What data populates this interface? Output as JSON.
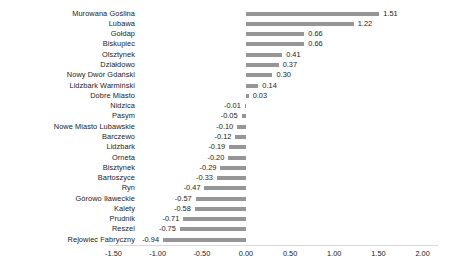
{
  "chart_data": {
    "type": "bar",
    "orientation": "horizontal",
    "title": "",
    "subtitle": "",
    "xlabel": "",
    "ylabel": "",
    "xlim": [
      -1.5,
      2.0
    ],
    "xticks": [
      -1.5,
      -1.0,
      -0.5,
      0.0,
      0.5,
      1.0,
      1.5,
      2.0
    ],
    "xtick_labels": [
      "-1.50",
      "-1.00",
      "-0.50",
      "0.00",
      "0.50",
      "1.00",
      "1.50",
      "2.00"
    ],
    "grid": false,
    "legend": null,
    "bar_color": "#969696",
    "text_color": "#1a1a1a",
    "axis_color": "#d9d9d9",
    "data_labels": true,
    "categories": [
      "Murowana Goślina",
      "Lubawa",
      "Gołdap",
      "Biskupiec",
      "Olsztynek",
      "Działdowo",
      "Nowy Dwór Gdański",
      "Lidzbark Warmiński",
      "Dobre Miasto",
      "Nidzica",
      "Pasym",
      "Nowe Miasto Lubawskie",
      "Barczewo",
      "Lidzbark",
      "Orneta",
      "Bisztynek",
      "Bartoszyce",
      "Ryn",
      "Górowo Iławeckie",
      "Kalety",
      "Prudnik",
      "Reszel",
      "Rejowiec Fabryczny"
    ],
    "values": [
      1.51,
      1.22,
      0.66,
      0.66,
      0.41,
      0.37,
      0.3,
      0.14,
      0.03,
      -0.01,
      -0.05,
      -0.1,
      -0.12,
      -0.19,
      -0.2,
      -0.29,
      -0.33,
      -0.47,
      -0.57,
      -0.58,
      -0.71,
      -0.75,
      -0.94
    ],
    "value_labels": [
      "1.51",
      "1.22",
      "0.66",
      "0.66",
      "0.41",
      "0.37",
      "0.30",
      "0.14",
      "0.03",
      "-0.01",
      "-0.05",
      "-0.10",
      "-0.12",
      "-0.19",
      "-0.20",
      "-0.29",
      "-0.33",
      "-0.47",
      "-0.57",
      "-0.58",
      "-0.71",
      "-0.75",
      "-0.94"
    ]
  }
}
